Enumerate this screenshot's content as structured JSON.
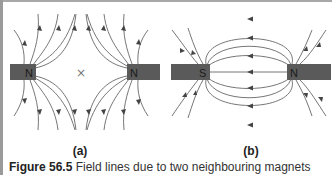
{
  "figure": {
    "panels": [
      {
        "id": "a",
        "label": "(a)",
        "magnets": [
          {
            "pole_label": "N",
            "side": "left"
          },
          {
            "pole_label": "N",
            "side": "right"
          }
        ],
        "neutral_point_marker": "×",
        "description": "Two like (N–N) poles facing each other; field lines diverge with a neutral point between them"
      },
      {
        "id": "b",
        "label": "(b)",
        "magnets": [
          {
            "pole_label": "S",
            "side": "left"
          },
          {
            "pole_label": "N",
            "side": "right"
          }
        ],
        "description": "Unlike poles (S–N) facing; field lines run from N to S"
      }
    ],
    "caption": {
      "number": "Figure 56.5",
      "text": "Field lines due to two neighbouring magnets"
    },
    "colors": {
      "magnet_fill": "#5a5a5a",
      "line_color": "#555555",
      "border": "#9a9a9a"
    }
  }
}
